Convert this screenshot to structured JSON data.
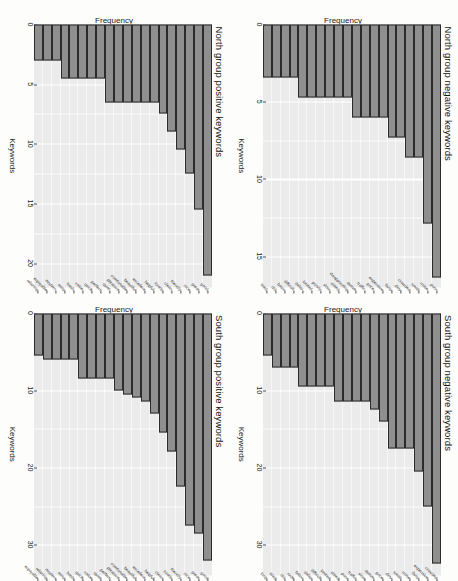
{
  "figure": {
    "rotation_note": "scanned page, content rotated 90 degrees",
    "bar_fill": "#8f8f8f",
    "bar_outline": "#2b2b2b",
    "panel_bg": "#ebebeb",
    "gridline_color": "#ffffff"
  },
  "chart_data": [
    {
      "type": "bar",
      "orientation": "horizontal",
      "title": "North group negative keywords",
      "xlabel": "Keywords",
      "ylabel": "Frequency",
      "ylim": [
        0,
        17
      ],
      "ticks": [
        0,
        5,
        10,
        15
      ],
      "grid": true,
      "legend": "none",
      "categories": [
        "poor",
        "noise",
        "small",
        "crowded",
        "dirty",
        "busy",
        "expensive",
        "price",
        "traffic",
        "queue",
        "disappointing",
        "dated",
        "slow",
        "poorly",
        "limited",
        "delay",
        "difficult",
        "basic",
        "old",
        "tired"
      ],
      "values": [
        16.4,
        12.9,
        8.6,
        8.6,
        7.3,
        7.3,
        6.0,
        6.0,
        6.0,
        6.0,
        4.7,
        4.7,
        4.7,
        4.7,
        4.7,
        4.7,
        3.4,
        3.4,
        3.4,
        3.4
      ]
    },
    {
      "type": "bar",
      "orientation": "horizontal",
      "title": "South group negative keywords",
      "xlabel": "Keywords",
      "ylabel": "Frequency",
      "ylim": [
        0,
        34
      ],
      "ticks": [
        0,
        10,
        20,
        30
      ],
      "grid": true,
      "legend": "none",
      "categories": [
        "crowded",
        "expensive",
        "busy",
        "noise",
        "small",
        "dirty",
        "price",
        "queue",
        "slow",
        "traffic",
        "poor",
        "dated",
        "limited",
        "difficult",
        "delay",
        "basic",
        "rude",
        "old",
        "tired",
        "long"
      ],
      "values": [
        32.5,
        25.0,
        20.5,
        17.5,
        17.5,
        17.5,
        14.0,
        12.5,
        11.5,
        11.5,
        11.5,
        11.5,
        9.5,
        9.5,
        9.5,
        9.5,
        7.0,
        7.0,
        7.0,
        5.5
      ]
    },
    {
      "type": "bar",
      "orientation": "horizontal",
      "title": "North group positive keywords",
      "xlabel": "Keywords",
      "ylabel": "Frequency",
      "ylim": [
        0,
        22
      ],
      "ticks": [
        0,
        5,
        10,
        15,
        20
      ],
      "grid": true,
      "legend": "none",
      "categories": [
        "good",
        "great",
        "nice",
        "friendly",
        "clean",
        "lovely",
        "helpful",
        "excellent",
        "beautiful",
        "comfortable",
        "pleasant",
        "quiet",
        "perfect",
        "quick",
        "value",
        "fresh",
        "easy",
        "modern",
        "enjoyable",
        "relaxing"
      ],
      "values": [
        21.0,
        15.5,
        12.5,
        10.5,
        9.0,
        7.5,
        6.5,
        6.5,
        6.5,
        6.5,
        6.5,
        6.5,
        4.5,
        4.5,
        4.5,
        4.5,
        4.5,
        3.0,
        3.0,
        3.0
      ]
    },
    {
      "type": "bar",
      "orientation": "horizontal",
      "title": "South group positive keywords",
      "xlabel": "Keywords",
      "ylabel": "Frequency",
      "ylim": [
        0,
        34
      ],
      "ticks": [
        0,
        10,
        20,
        30
      ],
      "grid": true,
      "legend": "none",
      "categories": [
        "good",
        "great",
        "nice",
        "friendly",
        "lovely",
        "clean",
        "helpful",
        "excellent",
        "beautiful",
        "comfortable",
        "pleasant",
        "perfect",
        "quiet",
        "value",
        "quick",
        "fresh",
        "easy",
        "modern",
        "relaxing",
        "enjoyable"
      ],
      "values": [
        32.0,
        28.5,
        27.5,
        22.5,
        18.0,
        15.5,
        13.0,
        11.5,
        11.0,
        10.5,
        10.0,
        8.5,
        8.5,
        8.5,
        8.5,
        6.0,
        6.0,
        6.0,
        6.0,
        5.5
      ]
    }
  ]
}
